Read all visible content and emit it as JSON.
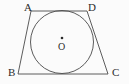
{
  "figure": {
    "background_color": "#fbfbfb",
    "stroke_color": "#4a4a4a",
    "label_color": "#2b2b2b",
    "labels": {
      "A": "A",
      "B": "B",
      "C": "C",
      "D": "D",
      "O": "O"
    }
  },
  "chart_data": {
    "type": "diagram",
    "shapes": [
      {
        "name": "trapezoid-ABCD",
        "kind": "polygon",
        "vertices": [
          {
            "label": "A",
            "x": 31,
            "y": 11
          },
          {
            "label": "D",
            "x": 87,
            "y": 11
          },
          {
            "label": "C",
            "x": 108,
            "y": 74
          },
          {
            "label": "B",
            "x": 18,
            "y": 74
          }
        ],
        "sides": [
          "AD",
          "DC",
          "CB",
          "BA"
        ],
        "closed": true,
        "filled": false
      },
      {
        "name": "inscribed-circle",
        "kind": "circle",
        "center": {
          "label": "O",
          "x": 62,
          "y": 42
        },
        "radius": 31.5,
        "tangent_to": [
          "AD",
          "DC",
          "CB",
          "BA"
        ],
        "filled": false
      },
      {
        "name": "center-point",
        "kind": "point",
        "x": 62,
        "y": 38,
        "radius": 1.3
      }
    ],
    "annotations": [
      {
        "text": "A",
        "x": 28,
        "y": 7,
        "anchor": "vertex-A"
      },
      {
        "text": "D",
        "x": 92,
        "y": 7,
        "anchor": "vertex-D"
      },
      {
        "text": "B",
        "x": 12,
        "y": 72,
        "anchor": "vertex-B"
      },
      {
        "text": "C",
        "x": 116,
        "y": 72,
        "anchor": "vertex-C"
      },
      {
        "text": "O",
        "x": 62,
        "y": 47,
        "anchor": "circle-center"
      }
    ],
    "xlim": [
      0,
      129
    ],
    "ylim": [
      84,
      0
    ],
    "grid": false,
    "axes_visible": false,
    "legend": null
  }
}
